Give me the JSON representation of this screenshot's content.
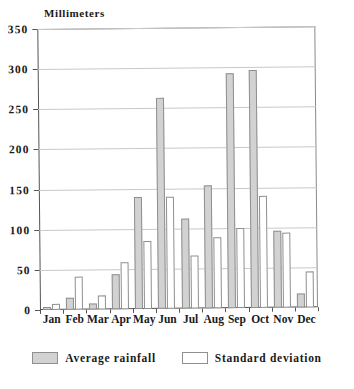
{
  "chart_data": {
    "type": "bar",
    "title": "Millimeters",
    "xlabel": "",
    "ylabel": "Millimeters",
    "ylim": [
      0,
      350
    ],
    "ytick_step": 50,
    "yticks": [
      "0",
      "50",
      "100",
      "150",
      "200",
      "250",
      "300",
      "350"
    ],
    "grid": true,
    "legend_position": "bottom-center",
    "categories": [
      "Jan",
      "Feb",
      "Mar",
      "Apr",
      "May",
      "Jun",
      "Jul",
      "Aug",
      "Sep",
      "Oct",
      "Nov",
      "Dec"
    ],
    "series": [
      {
        "name": "Average rainfall",
        "color": "#d2d2d2",
        "values": [
          4,
          15,
          7,
          43,
          140,
          263,
          112,
          153,
          293,
          296,
          96,
          18
        ]
      },
      {
        "name": "Standard deviation",
        "color": "#ffffff",
        "values": [
          8,
          41,
          18,
          59,
          85,
          139,
          66,
          88,
          100,
          139,
          94,
          45
        ]
      }
    ]
  },
  "legend": {
    "items": [
      {
        "label": "Average rainfall",
        "swatch": "avg"
      },
      {
        "label": "Standard deviation",
        "swatch": "std"
      }
    ]
  }
}
